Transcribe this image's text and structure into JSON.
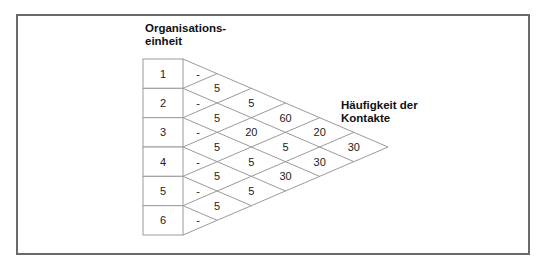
{
  "labels": {
    "org_unit_line1": "Organisations-",
    "org_unit_line2": "einheit",
    "freq_line1": "Häufigkeit der",
    "freq_line2": "Kontakte"
  },
  "units": [
    "1",
    "2",
    "3",
    "4",
    "5",
    "6"
  ],
  "self_values": [
    "-",
    "-",
    "-",
    "-",
    "-",
    "-"
  ],
  "pair_values": {
    "1-2": "5",
    "2-3": "5",
    "3-4": "5",
    "4-5": "5",
    "5-6": "5",
    "1-3": "5",
    "2-4": "20",
    "3-5": "5",
    "4-6": "5",
    "1-4": "60",
    "2-5": "5",
    "3-6": "30",
    "1-5": "20",
    "2-6": "30",
    "1-6": "30"
  },
  "colors": {
    "frame": "#6a6a6a",
    "grid_lines": "#9a9a9a",
    "text": "#222222"
  }
}
